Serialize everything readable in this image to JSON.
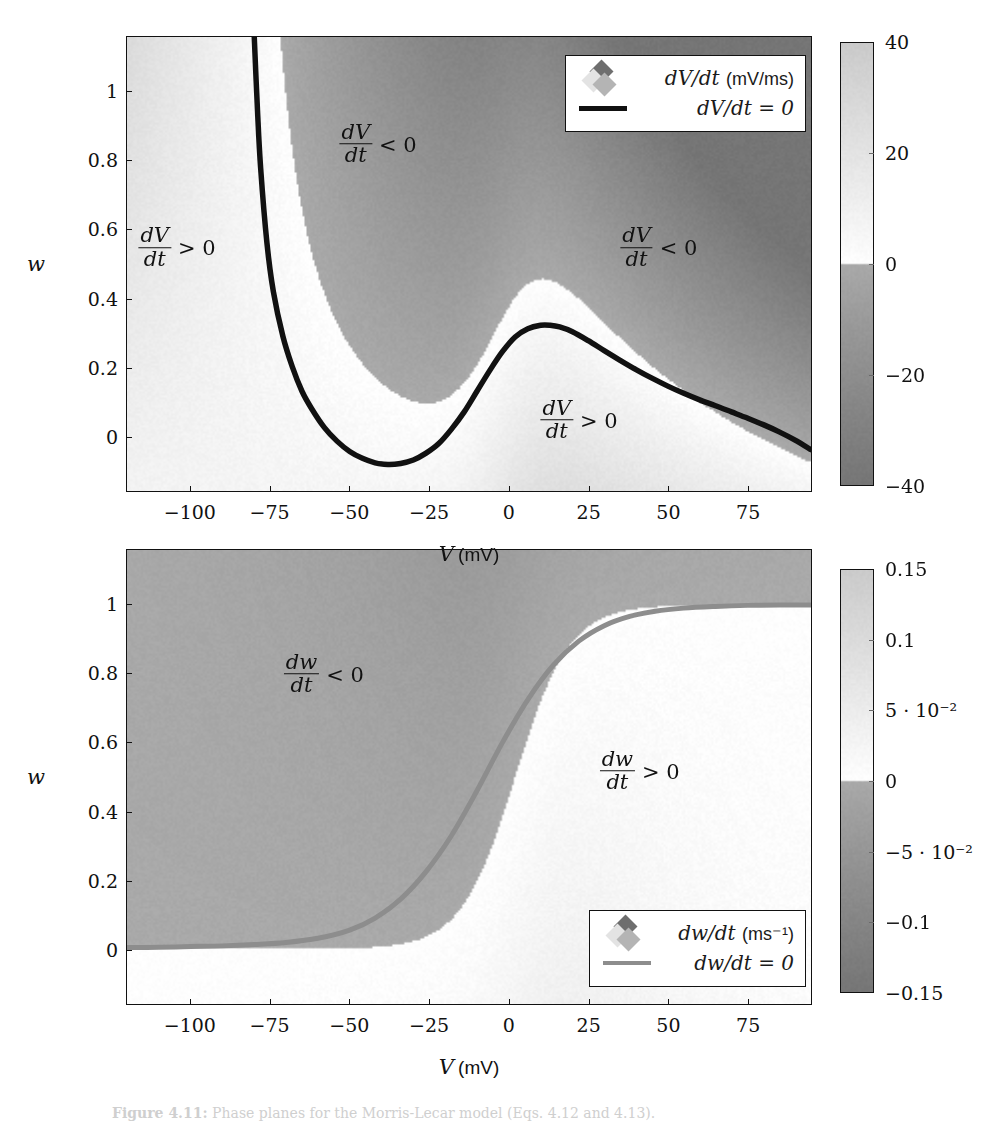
{
  "figure": {
    "caption_label": "Figure 4.11:",
    "caption_text": "Phase planes for the Morris-Lecar model (Eqs. 4.12 and 4.13)."
  },
  "panels": [
    {
      "id": "top",
      "x_axis": {
        "title_var": "V",
        "title_unit": "(mV)",
        "ticks": [
          "−100",
          "−75",
          "−50",
          "−25",
          "0",
          "25",
          "50",
          "75"
        ],
        "tick_values": [
          -100,
          -75,
          -50,
          -25,
          0,
          25,
          50,
          75
        ],
        "range": [
          -120,
          95
        ]
      },
      "y_axis": {
        "title": "w",
        "ticks": [
          "0",
          "0.2",
          "0.4",
          "0.6",
          "0.8",
          "1"
        ],
        "tick_values": [
          0,
          0.2,
          0.4,
          0.6,
          0.8,
          1
        ],
        "range": [
          -0.16,
          1.16
        ]
      },
      "legend": {
        "heat_label_num": "dV",
        "heat_label_den": "dt",
        "heat_label": "dV/dt",
        "heat_unit": "(mV/ms)",
        "line_label": "dV/dt = 0",
        "line_color": "#111111"
      },
      "colorbar": {
        "ticks": [
          "40",
          "20",
          "0",
          "−20",
          "−40"
        ],
        "tick_values": [
          40,
          20,
          0,
          -20,
          -40
        ],
        "range": [
          -40,
          40
        ]
      },
      "annotations": [
        {
          "num": "dV",
          "den": "dt",
          "rel": "> 0",
          "x": -104,
          "y": 0.545
        },
        {
          "num": "dV",
          "den": "dt",
          "rel": "< 0",
          "x": -41,
          "y": 0.845
        },
        {
          "num": "dV",
          "den": "dt",
          "rel": "< 0",
          "x": 47,
          "y": 0.545
        },
        {
          "num": "dV",
          "den": "dt",
          "rel": "> 0",
          "x": 22,
          "y": 0.045
        }
      ]
    },
    {
      "id": "bottom",
      "x_axis": {
        "title_var": "V",
        "title_unit": "(mV)",
        "ticks": [
          "−100",
          "−75",
          "−50",
          "−25",
          "0",
          "25",
          "50",
          "75"
        ],
        "tick_values": [
          -100,
          -75,
          -50,
          -25,
          0,
          25,
          50,
          75
        ],
        "range": [
          -120,
          95
        ]
      },
      "y_axis": {
        "title": "w",
        "ticks": [
          "0",
          "0.2",
          "0.4",
          "0.6",
          "0.8",
          "1"
        ],
        "tick_values": [
          0,
          0.2,
          0.4,
          0.6,
          0.8,
          1
        ],
        "range": [
          -0.16,
          1.16
        ]
      },
      "legend": {
        "heat_label_num": "dw",
        "heat_label_den": "dt",
        "heat_label": "dw/dt",
        "heat_unit": "(ms⁻¹)",
        "line_label": "dw/dt = 0",
        "line_color": "#8d8d8d"
      },
      "colorbar": {
        "ticks": [
          "0.15",
          "0.1",
          "5 · 10⁻²",
          "0",
          "−5 · 10⁻²",
          "−0.1",
          "−0.15"
        ],
        "tick_values": [
          0.15,
          0.1,
          0.05,
          0,
          -0.05,
          -0.1,
          -0.15
        ],
        "range": [
          -0.15,
          0.15
        ]
      },
      "annotations": [
        {
          "num": "dw",
          "den": "dt",
          "rel": "< 0",
          "x": -58,
          "y": 0.795
        },
        {
          "num": "dw",
          "den": "dt",
          "rel": "> 0",
          "x": 41,
          "y": 0.515
        }
      ]
    }
  ],
  "chart_data": [
    {
      "type": "heatmap",
      "panel": "top",
      "title": "",
      "xlabel": "V (mV)",
      "ylabel": "w",
      "zlabel": "dV/dt (mV/ms)",
      "xlim": [
        -120,
        95
      ],
      "ylim": [
        -0.16,
        1.16
      ],
      "zlim": [
        -40,
        40
      ],
      "colormap": "grayscale-diverging",
      "grid": false,
      "legend_position": "top-right",
      "nullcline": {
        "name": "dV/dt = 0",
        "color": "#111111",
        "V": [
          -80,
          -79,
          -78,
          -76,
          -74,
          -71,
          -68,
          -65,
          -62,
          -58,
          -54,
          -50,
          -46,
          -42,
          -38,
          -34,
          -30,
          -26,
          -22,
          -18,
          -14,
          -10,
          -6,
          -2,
          2,
          6,
          10,
          13,
          16,
          20,
          25,
          30,
          35,
          40,
          45,
          50,
          55,
          60,
          65,
          70,
          75,
          80,
          85,
          90,
          95
        ],
        "w": [
          1.16,
          0.95,
          0.78,
          0.56,
          0.42,
          0.29,
          0.2,
          0.13,
          0.08,
          0.025,
          -0.015,
          -0.045,
          -0.065,
          -0.078,
          -0.083,
          -0.08,
          -0.07,
          -0.05,
          -0.022,
          0.02,
          0.07,
          0.13,
          0.19,
          0.245,
          0.288,
          0.312,
          0.322,
          0.322,
          0.317,
          0.303,
          0.277,
          0.248,
          0.22,
          0.193,
          0.168,
          0.145,
          0.124,
          0.105,
          0.088,
          0.07,
          0.052,
          0.033,
          0.012,
          -0.012,
          -0.04
        ]
      }
    },
    {
      "type": "heatmap",
      "panel": "bottom",
      "title": "",
      "xlabel": "V (mV)",
      "ylabel": "w",
      "zlabel": "dw/dt (ms⁻¹)",
      "xlim": [
        -120,
        95
      ],
      "ylim": [
        -0.16,
        1.16
      ],
      "zlim": [
        -0.15,
        0.15
      ],
      "colormap": "grayscale-diverging",
      "grid": false,
      "legend_position": "bottom-right",
      "nullcline": {
        "name": "dw/dt = 0",
        "color": "#8d8d8d",
        "V": [
          -120,
          -110,
          -100,
          -90,
          -80,
          -70,
          -60,
          -50,
          -42,
          -34,
          -26,
          -18,
          -10,
          -2,
          6,
          14,
          22,
          30,
          38,
          46,
          55,
          65,
          75,
          85,
          95
        ],
        "w": [
          0.004,
          0.005,
          0.007,
          0.009,
          0.013,
          0.019,
          0.031,
          0.055,
          0.09,
          0.145,
          0.225,
          0.33,
          0.46,
          0.6,
          0.725,
          0.825,
          0.895,
          0.94,
          0.967,
          0.982,
          0.991,
          0.996,
          0.999,
          1.0,
          1.0
        ]
      }
    }
  ]
}
